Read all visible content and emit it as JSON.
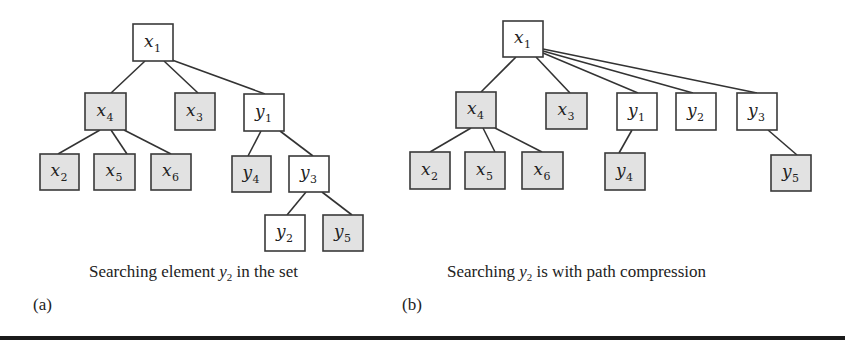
{
  "panels": [
    {
      "id": "a",
      "label": "(a)",
      "caption": {
        "before": "Searching element ",
        "var": "y",
        "sub": "2",
        "after": " in the set"
      },
      "nodes": [
        {
          "id": "a-x1",
          "var": "x",
          "sub": "1",
          "shaded": false,
          "x": 133,
          "y": 24,
          "w": 40,
          "h": 37
        },
        {
          "id": "a-x4",
          "var": "x",
          "sub": "4",
          "shaded": true,
          "x": 85,
          "y": 93,
          "w": 41,
          "h": 37
        },
        {
          "id": "a-x3",
          "var": "x",
          "sub": "3",
          "shaded": true,
          "x": 175,
          "y": 93,
          "w": 40,
          "h": 37
        },
        {
          "id": "a-y1",
          "var": "y",
          "sub": "1",
          "shaded": false,
          "x": 244,
          "y": 94,
          "w": 40,
          "h": 37
        },
        {
          "id": "a-x2",
          "var": "x",
          "sub": "2",
          "shaded": true,
          "x": 40,
          "y": 154,
          "w": 39,
          "h": 36
        },
        {
          "id": "a-x5",
          "var": "x",
          "sub": "5",
          "shaded": true,
          "x": 94,
          "y": 154,
          "w": 41,
          "h": 36
        },
        {
          "id": "a-x6",
          "var": "x",
          "sub": "6",
          "shaded": true,
          "x": 151,
          "y": 154,
          "w": 40,
          "h": 36
        },
        {
          "id": "a-y4",
          "var": "y",
          "sub": "4",
          "shaded": true,
          "x": 232,
          "y": 156,
          "w": 39,
          "h": 36
        },
        {
          "id": "a-y3",
          "var": "y",
          "sub": "3",
          "shaded": false,
          "x": 289,
          "y": 156,
          "w": 40,
          "h": 36
        },
        {
          "id": "a-y2",
          "var": "y",
          "sub": "2",
          "shaded": false,
          "x": 265,
          "y": 215,
          "w": 40,
          "h": 36
        },
        {
          "id": "a-y5",
          "var": "y",
          "sub": "5",
          "shaded": true,
          "x": 323,
          "y": 215,
          "w": 40,
          "h": 36
        }
      ],
      "edges": [
        {
          "from": "a-x1",
          "to": "a-x4",
          "x1": 145,
          "y1": 61,
          "x2": 111,
          "y2": 93
        },
        {
          "from": "a-x1",
          "to": "a-x3",
          "x1": 164,
          "y1": 61,
          "x2": 198,
          "y2": 93
        },
        {
          "from": "a-x1",
          "to": "a-y1",
          "x1": 172,
          "y1": 60,
          "x2": 265,
          "y2": 94
        },
        {
          "from": "a-x4",
          "to": "a-x2",
          "x1": 100,
          "y1": 130,
          "x2": 58,
          "y2": 154
        },
        {
          "from": "a-x4",
          "to": "a-x5",
          "x1": 111,
          "y1": 130,
          "x2": 127,
          "y2": 154
        },
        {
          "from": "a-x4",
          "to": "a-x6",
          "x1": 124,
          "y1": 130,
          "x2": 171,
          "y2": 154
        },
        {
          "from": "a-y1",
          "to": "a-y4",
          "x1": 261,
          "y1": 131,
          "x2": 248,
          "y2": 156
        },
        {
          "from": "a-y1",
          "to": "a-y3",
          "x1": 280,
          "y1": 131,
          "x2": 313,
          "y2": 156
        },
        {
          "from": "a-y3",
          "to": "a-y2",
          "x1": 306,
          "y1": 192,
          "x2": 287,
          "y2": 215
        },
        {
          "from": "a-y3",
          "to": "a-y5",
          "x1": 322,
          "y1": 192,
          "x2": 352,
          "y2": 215
        }
      ]
    },
    {
      "id": "b",
      "label": "(b)",
      "caption": {
        "before": "Searching ",
        "var": "y",
        "sub": "2",
        "after": " is with path compression"
      },
      "nodes": [
        {
          "id": "b-x1",
          "var": "x",
          "sub": "1",
          "shaded": false,
          "x": 503,
          "y": 21,
          "w": 40,
          "h": 36
        },
        {
          "id": "b-x4",
          "var": "x",
          "sub": "4",
          "shaded": true,
          "x": 456,
          "y": 92,
          "w": 40,
          "h": 36
        },
        {
          "id": "b-x3",
          "var": "x",
          "sub": "3",
          "shaded": true,
          "x": 546,
          "y": 93,
          "w": 41,
          "h": 36
        },
        {
          "id": "b-y1",
          "var": "y",
          "sub": "1",
          "shaded": false,
          "x": 617,
          "y": 93,
          "w": 40,
          "h": 37
        },
        {
          "id": "b-y2",
          "var": "y",
          "sub": "2",
          "shaded": false,
          "x": 676,
          "y": 93,
          "w": 40,
          "h": 37
        },
        {
          "id": "b-y3",
          "var": "y",
          "sub": "3",
          "shaded": false,
          "x": 737,
          "y": 93,
          "w": 40,
          "h": 37
        },
        {
          "id": "b-x2",
          "var": "x",
          "sub": "2",
          "shaded": true,
          "x": 410,
          "y": 152,
          "w": 40,
          "h": 37
        },
        {
          "id": "b-x5",
          "var": "x",
          "sub": "5",
          "shaded": true,
          "x": 465,
          "y": 152,
          "w": 40,
          "h": 37
        },
        {
          "id": "b-x6",
          "var": "x",
          "sub": "6",
          "shaded": true,
          "x": 522,
          "y": 152,
          "w": 41,
          "h": 37
        },
        {
          "id": "b-y4",
          "var": "y",
          "sub": "4",
          "shaded": true,
          "x": 605,
          "y": 153,
          "w": 40,
          "h": 37
        },
        {
          "id": "b-y5",
          "var": "y",
          "sub": "5",
          "shaded": true,
          "x": 771,
          "y": 155,
          "w": 40,
          "h": 36
        }
      ],
      "edges": [
        {
          "from": "b-x1",
          "to": "b-x4",
          "x1": 516,
          "y1": 57,
          "x2": 481,
          "y2": 92
        },
        {
          "from": "b-x1",
          "to": "b-x3",
          "x1": 536,
          "y1": 57,
          "x2": 570,
          "y2": 93
        },
        {
          "from": "b-x1",
          "to": "b-y1",
          "x1": 543,
          "y1": 53,
          "x2": 638,
          "y2": 93
        },
        {
          "from": "b-x1",
          "to": "b-y2",
          "x1": 543,
          "y1": 51,
          "x2": 693,
          "y2": 93
        },
        {
          "from": "b-x1",
          "to": "b-y3",
          "x1": 543,
          "y1": 49,
          "x2": 757,
          "y2": 93
        },
        {
          "from": "b-x4",
          "to": "b-x2",
          "x1": 471,
          "y1": 128,
          "x2": 430,
          "y2": 152
        },
        {
          "from": "b-x4",
          "to": "b-x5",
          "x1": 483,
          "y1": 128,
          "x2": 495,
          "y2": 152
        },
        {
          "from": "b-x4",
          "to": "b-x6",
          "x1": 495,
          "y1": 128,
          "x2": 542,
          "y2": 152
        },
        {
          "from": "b-y1",
          "to": "b-y4",
          "x1": 632,
          "y1": 130,
          "x2": 619,
          "y2": 153
        },
        {
          "from": "b-y3",
          "to": "b-y5",
          "x1": 768,
          "y1": 130,
          "x2": 797,
          "y2": 155
        }
      ]
    }
  ]
}
